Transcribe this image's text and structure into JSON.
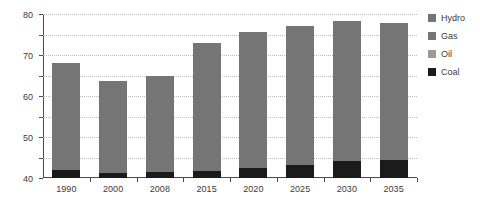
{
  "chart_data": {
    "type": "bar",
    "stacked": true,
    "title": "",
    "xlabel": "",
    "ylabel": "TWh",
    "ylim": [
      0,
      80
    ],
    "yticks": [
      0,
      10,
      20,
      30,
      40,
      50,
      60,
      70,
      80
    ],
    "grid": true,
    "legend_position": "right",
    "categories": [
      "1990",
      "2000",
      "2008",
      "2015",
      "2020",
      "2025",
      "2030",
      "2035"
    ],
    "series": [
      {
        "name": "Coal",
        "color": "#1b1b1b",
        "values": [
          4.0,
          2.5,
          3.0,
          3.5,
          5.0,
          6.5,
          8.5,
          9.0
        ]
      },
      {
        "name": "Oil",
        "color": "#757575",
        "values": [
          0.5,
          0.5,
          0.5,
          0.5,
          0.5,
          0.5,
          0.5,
          0.5
        ]
      },
      {
        "name": "Gas",
        "color": "#757575",
        "values": [
          46.5,
          39.5,
          41.5,
          57.0,
          60.5,
          62.0,
          62.5,
          61.0
        ]
      },
      {
        "name": "Hydro",
        "color": "#757575",
        "values": [
          5.0,
          5.0,
          5.0,
          5.0,
          5.0,
          5.0,
          5.0,
          5.0
        ]
      }
    ],
    "totals": [
      56.0,
      47.5,
      50.0,
      66.0,
      71.0,
      74.0,
      76.5,
      75.5
    ],
    "annotations": []
  },
  "axes": {
    "y_title": "TWh",
    "y_labels": [
      "80",
      "70",
      "60",
      "50",
      "40",
      "30",
      "20",
      "10",
      "0"
    ],
    "x_labels": [
      "1990",
      "2000",
      "2008",
      "2015",
      "2020",
      "2025",
      "2030",
      "2035"
    ]
  },
  "legend": {
    "items": [
      {
        "label": "Hydro",
        "color": "#757575"
      },
      {
        "label": "Gas",
        "color": "#757575"
      },
      {
        "label": "Oil",
        "color": "#9a9a9a"
      },
      {
        "label": "Coal",
        "color": "#1b1b1b"
      }
    ]
  },
  "style": {
    "background": "#ffffff",
    "axis_color": "#4a4a4a",
    "grid_color": "#bdbdbd",
    "text_color": "#3b3b3b"
  }
}
